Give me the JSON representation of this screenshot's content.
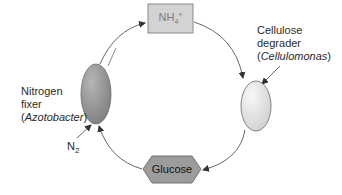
{
  "diagram": {
    "type": "cycle",
    "nodes": {
      "ammonium": {
        "label_main": "NH",
        "label_sub": "4",
        "label_sup": "+",
        "shape": "rectangle",
        "fill": "#d3d3d3",
        "stroke": "#8a8a8a"
      },
      "cellulose_degrader": {
        "shape": "ellipse",
        "fill": "#e6e6e6",
        "stroke": "#6a6a6a"
      },
      "glucose": {
        "label": "Glucose",
        "shape": "hexagon",
        "fill": "#9c9c9c",
        "stroke": "#6a6a6a"
      },
      "nitrogen_fixer": {
        "shape": "ellipse",
        "fill": "#8f8f8f",
        "stroke": "#6a6a6a"
      }
    },
    "labels": {
      "cellulose_degrader": {
        "line1": "Cellulose",
        "line2": "degrader",
        "open": "(",
        "organism": "Cellulomonas",
        "close": ")"
      },
      "nitrogen_fixer": {
        "line1": "Nitrogen",
        "line2": "fixer",
        "open": "(",
        "organism": "Azotobacter",
        "close": ")"
      },
      "n2": {
        "main": "N",
        "sub": "2"
      }
    },
    "edges": [
      {
        "from": "nitrogen_fixer",
        "to": "ammonium"
      },
      {
        "from": "ammonium",
        "to": "cellulose_degrader"
      },
      {
        "from": "cellulose_degrader",
        "to": "glucose"
      },
      {
        "from": "glucose",
        "to": "nitrogen_fixer"
      },
      {
        "from": "n2",
        "to": "nitrogen_fixer"
      }
    ],
    "colors": {
      "arrow": "#555555"
    }
  }
}
